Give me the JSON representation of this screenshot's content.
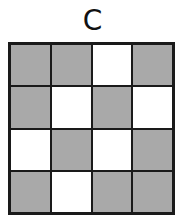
{
  "label": "C",
  "colors": {
    "shaded": "#a9a9a9",
    "empty": "#ffffff",
    "border": "#1a1a1a"
  },
  "grid": {
    "rows": 4,
    "cols": 4,
    "cells": [
      [
        "shaded",
        "shaded",
        "empty",
        "shaded"
      ],
      [
        "shaded",
        "empty",
        "shaded",
        "empty"
      ],
      [
        "empty",
        "shaded",
        "empty",
        "shaded"
      ],
      [
        "shaded",
        "empty",
        "shaded",
        "shaded"
      ]
    ]
  }
}
